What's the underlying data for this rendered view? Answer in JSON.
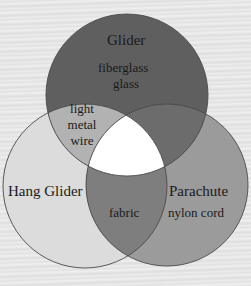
{
  "diagram": {
    "type": "venn",
    "sets": [
      {
        "id": "glider",
        "label": "Glider",
        "only_items": [
          "fiberglass",
          "glass"
        ],
        "color": "#5f5f5f"
      },
      {
        "id": "hang_glider",
        "label": "Hang Glider",
        "only_items": [],
        "color": "#dcdcdc"
      },
      {
        "id": "parachute",
        "label": "Parachute",
        "only_items": [
          "nylon cord"
        ],
        "color": "#9b9b9b"
      }
    ],
    "intersections": [
      {
        "sets": [
          "glider",
          "hang_glider"
        ],
        "items": [
          "light",
          "metal",
          "wire"
        ],
        "color": "#b2b2b2"
      },
      {
        "sets": [
          "hang_glider",
          "parachute"
        ],
        "items": [
          "fabric"
        ],
        "color": "#7e7e7e"
      },
      {
        "sets": [
          "glider",
          "parachute"
        ],
        "items": [],
        "color": "#6c6c6c"
      },
      {
        "sets": [
          "glider",
          "hang_glider",
          "parachute"
        ],
        "items": [],
        "color": "#ffffff"
      }
    ],
    "colors": {
      "background": "#e6e6e6",
      "outline": "#4a4a4a"
    }
  }
}
